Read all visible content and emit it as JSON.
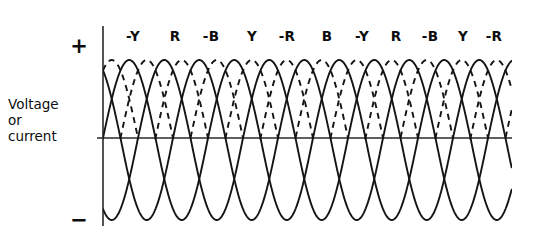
{
  "figure": {
    "title_lines": [
      "Voltage",
      "or",
      "current"
    ],
    "positive_sign": "+",
    "negative_sign": "−",
    "line_color": "#141414",
    "axis_color": "#2a2a2a",
    "background_color": "#ffffff"
  },
  "phase_labels": [
    {
      "text": "-Y",
      "x": 133
    },
    {
      "text": "R",
      "x": 175
    },
    {
      "text": "-B",
      "x": 211
    },
    {
      "text": "Y",
      "x": 252
    },
    {
      "text": "-R",
      "x": 287
    },
    {
      "text": "B",
      "x": 327
    },
    {
      "text": "-Y",
      "x": 362
    },
    {
      "text": "R",
      "x": 396
    },
    {
      "text": "-B",
      "x": 430
    },
    {
      "text": "Y",
      "x": 463
    },
    {
      "text": "-R",
      "x": 494
    }
  ],
  "chart_data": {
    "type": "line",
    "title": "",
    "xlabel": "",
    "ylabel": "Voltage or current",
    "ytick_labels": [
      "+",
      "−"
    ],
    "grid": false,
    "legend": "none",
    "axes": {
      "origin_x": 103,
      "zero_y": 138,
      "vertical_axis_top": 26,
      "vertical_axis_bottom": 226,
      "zero_line_right": 512,
      "plot_right": 512
    },
    "waveform": {
      "description": "Six-phase sinusoidal set: three solid and three dashed sinusoids, 120 degrees apart, drawn over the zero axis. Positive half-cycle crests are annotated with phase names. Negative lobes are drawn solid only and extend below the visible frame.",
      "period_px": 105,
      "half_period_px": 52.5,
      "crest_spacing_px": 35,
      "positive_amplitude_px": 78,
      "negative_amplitude_px": 82,
      "phase_offsets_deg": [
        0,
        60,
        120,
        180,
        240,
        300
      ],
      "series": [
        {
          "name": "R",
          "style": "solid",
          "phase_deg": 0
        },
        {
          "name": "-B",
          "style": "dashed",
          "phase_deg": 60
        },
        {
          "name": "Y",
          "style": "solid",
          "phase_deg": 120
        },
        {
          "name": "-R",
          "style": "dashed",
          "phase_deg": 180
        },
        {
          "name": "B",
          "style": "solid",
          "phase_deg": 240
        },
        {
          "name": "-Y",
          "style": "dashed",
          "phase_deg": 300
        }
      ],
      "x_start": 103,
      "x_end": 512
    }
  }
}
